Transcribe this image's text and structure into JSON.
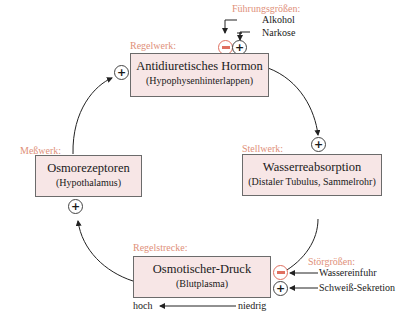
{
  "labels": {
    "fuehrungsgroessen": "Führungsgrößen:",
    "regelwerk": "Regelwerk:",
    "messwerk": "Meßwerk:",
    "stellwerk": "Stellwerk:",
    "regelstrecke": "Regelstrecke:",
    "stoergroessen": "Störgrößen:"
  },
  "boxes": {
    "hormon": {
      "title": "Antidiuretisches Hormon",
      "sub": "(Hypophysenhinterlappen)"
    },
    "osmo": {
      "title": "Osmorezeptoren",
      "sub": "(Hypothalamus)"
    },
    "wasser": {
      "title": "Wasserreabsorption",
      "sub": "(Distaler Tubulus, Sammelrohr)"
    },
    "druck": {
      "title": "Osmotischer-Druck",
      "sub": "(Blutplasma)"
    }
  },
  "inputs": {
    "alkohol": "Alkohol",
    "narkose": "Narkose",
    "wassereinfuhr": "Wassereinfuhr",
    "schweiss": "Schweiß-Sekretion"
  },
  "scale": {
    "hoch": "hoch",
    "niedrig": "niedrig"
  },
  "signs": {
    "plus": "+"
  },
  "colors": {
    "accent": "#e0907a",
    "box_fill": "#f7e6e6",
    "negative": "#e07060"
  }
}
